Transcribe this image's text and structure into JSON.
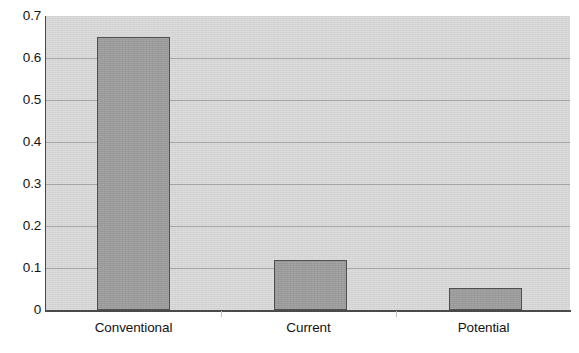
{
  "chart_data": {
    "type": "bar",
    "title": "",
    "subtitle": "",
    "xlabel": "",
    "ylabel": "",
    "categories": [
      "Conventional",
      "Current",
      "Potential"
    ],
    "values": [
      0.65,
      0.12,
      0.053
    ],
    "series": [
      {
        "name": "",
        "values": [
          0.65,
          0.12,
          0.053
        ]
      }
    ],
    "ylim": [
      0,
      0.7
    ],
    "xlim": [
      0,
      3
    ],
    "y_ticks": [
      0,
      0.1,
      0.2,
      0.3,
      0.4,
      0.5,
      0.6,
      0.7
    ],
    "y_tick_labels": [
      "0",
      "0.1",
      "0.2",
      "0.3",
      "0.4",
      "0.5",
      "0.6",
      "0.7"
    ],
    "grid": true,
    "grid_axis": "y",
    "legend": false,
    "legend_position": "none",
    "annotations": [],
    "colors": {
      "bar_fill": "#9a9a9a",
      "bar_border": "#4f4f4f",
      "plot_background": "#d4d4d4",
      "gridline": "#a3a3a3",
      "axis_line": "#4a4a4a",
      "text": "#141414",
      "figure_background": "#ffffff"
    }
  },
  "axes": {
    "y_labels": [
      {
        "text": "0.7",
        "value": 0.7
      },
      {
        "text": "0.6",
        "value": 0.6
      },
      {
        "text": "0.5",
        "value": 0.5
      },
      {
        "text": "0.4",
        "value": 0.4
      },
      {
        "text": "0.3",
        "value": 0.3
      },
      {
        "text": "0.2",
        "value": 0.2
      },
      {
        "text": "0.1",
        "value": 0.1
      },
      {
        "text": "0",
        "value": 0
      }
    ],
    "x_labels": [
      {
        "text": "Conventional"
      },
      {
        "text": "Current"
      },
      {
        "text": "Potential"
      }
    ]
  }
}
